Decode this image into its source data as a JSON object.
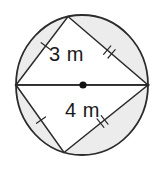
{
  "figure": {
    "type": "circle-with-inscribed-triangles",
    "labels": {
      "upper_chord": "3 m",
      "lower_chord": "4 m"
    },
    "tick_marks": [
      {
        "chord": "upper-left-chord",
        "label": "3 m",
        "ticks": 1
      },
      {
        "chord": "upper-right-chord",
        "label": "",
        "ticks": 2
      },
      {
        "chord": "lower-left-chord",
        "label": "",
        "ticks": 1
      },
      {
        "chord": "lower-right-chord",
        "label": "4 m",
        "ticks": 2
      }
    ],
    "colors": {
      "line": "#2b2b2b",
      "segment_fill": "#ececec",
      "triangle_fill": "#ffffff",
      "center_dot": "#111111",
      "label_text": "#1a1a1a",
      "background": "#ffffff"
    }
  }
}
